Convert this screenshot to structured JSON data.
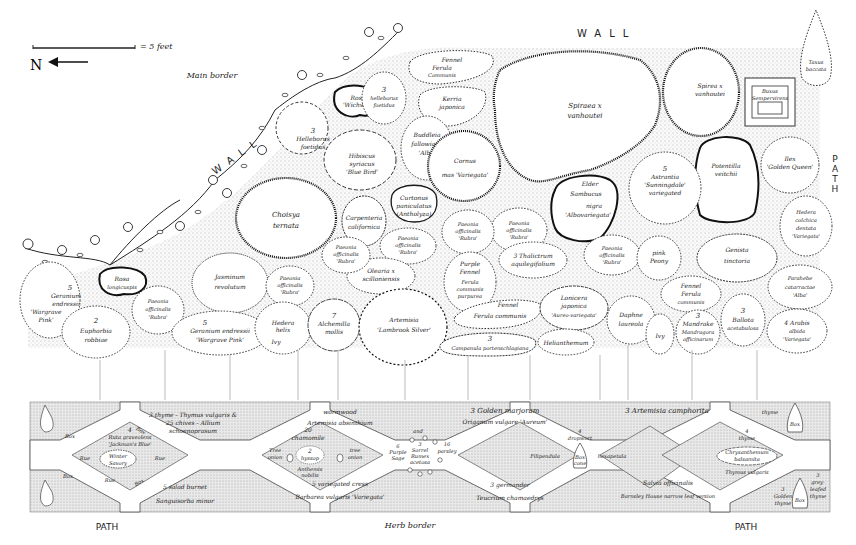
{
  "legend": {
    "scale_text": "= 5 feet",
    "north_label": "N"
  },
  "headings": {
    "wall_top": "WALL",
    "wall_diagonal": "WALL",
    "path_right": [
      "P",
      "A",
      "T",
      "H"
    ],
    "main_border": "Main border",
    "herb_border": "Herb border",
    "path_bottom_left": "PATH",
    "path_bottom_right": "PATH"
  },
  "main_border_plants": [
    {
      "id": "rosa-wichwar",
      "lines": [
        "Rosa",
        "'Wichwar'"
      ]
    },
    {
      "id": "helleborus-1",
      "lines": [
        "3",
        "helleborus",
        "foetidus"
      ]
    },
    {
      "id": "ferula-fennel",
      "lines": [
        "Fennel",
        "Ferula",
        "Communis"
      ]
    },
    {
      "id": "kerria",
      "lines": [
        "Kerria",
        "japonica"
      ]
    },
    {
      "id": "spiraea-large",
      "lines": [
        "Spiraea x",
        "vanhoutei"
      ]
    },
    {
      "id": "spiraea-small",
      "lines": [
        "Spirea x",
        "vanhoutei"
      ]
    },
    {
      "id": "buxus",
      "lines": [
        "Buxus",
        "Sempervirens"
      ]
    },
    {
      "id": "taxus",
      "lines": [
        "Taxus",
        "baccata"
      ]
    },
    {
      "id": "helleborus-2",
      "lines": [
        "3",
        "Helleborus",
        "foetidus"
      ]
    },
    {
      "id": "buddleia",
      "lines": [
        "Buddleia",
        "fallowiana",
        "'Alba'"
      ]
    },
    {
      "id": "hibiscus",
      "lines": [
        "Hibiscus",
        "syriacus",
        "'Blue Bird'"
      ]
    },
    {
      "id": "cornus",
      "lines": [
        "Cornus",
        "mas 'Variegata'"
      ]
    },
    {
      "id": "ilex",
      "lines": [
        "Ilex",
        "'Golden Queen'"
      ]
    },
    {
      "id": "potentilla",
      "lines": [
        "Potentilla",
        "veitchii"
      ]
    },
    {
      "id": "astrantia",
      "lines": [
        "5",
        "Astrantia",
        "'Sunningdale'",
        "variegated"
      ]
    },
    {
      "id": "sambucus",
      "lines": [
        "Elder",
        "Sambucus",
        "nigra",
        "'Albovariegata'"
      ]
    },
    {
      "id": "choisya",
      "lines": [
        "Choisya",
        "ternata"
      ]
    },
    {
      "id": "carpenteria",
      "lines": [
        "Carpenteria",
        "californica"
      ]
    },
    {
      "id": "curtonus",
      "lines": [
        "Curtonus",
        "paniculatus",
        "(Antholyza)"
      ]
    },
    {
      "id": "paeonia-a",
      "lines": [
        "Paeonia",
        "officinalis",
        "'Rubra'"
      ]
    },
    {
      "id": "paeonia-b",
      "lines": [
        "Paeonia",
        "officinalis",
        "'Rubra'"
      ]
    },
    {
      "id": "paeonia-c",
      "lines": [
        "Paeonia",
        "officinalis",
        "'Rubra'"
      ]
    },
    {
      "id": "hedera-colchica",
      "lines": [
        "Hedera",
        "colchica",
        "dentata",
        "'Variegata'"
      ]
    },
    {
      "id": "rosa-longicuspis",
      "lines": [
        "Rosa",
        "longicuspis"
      ]
    },
    {
      "id": "jasminum",
      "lines": [
        "Jasminum",
        "revolutum"
      ]
    },
    {
      "id": "paeonia-d",
      "lines": [
        "Paeonia",
        "officinalis",
        "'Rubra'"
      ]
    },
    {
      "id": "olearia",
      "lines": [
        "Olearia x",
        "scilloniensis"
      ]
    },
    {
      "id": "purple-fennel",
      "lines": [
        "Purple",
        "Fennel",
        "Ferula",
        "communis",
        "purpurea"
      ]
    },
    {
      "id": "thalictrum",
      "lines": [
        "3 Thalictrum",
        "aquilegifolium"
      ]
    },
    {
      "id": "paeonia-e",
      "lines": [
        "Paeonia",
        "officinalis",
        "'Rubra'"
      ]
    },
    {
      "id": "pink-peony",
      "lines": [
        "pink",
        "Peony"
      ]
    },
    {
      "id": "genista",
      "lines": [
        "Genista",
        "tinctoria"
      ]
    },
    {
      "id": "geranium-1",
      "lines": [
        "5",
        "Geranium",
        "endressii",
        "'Wargrave",
        "Pink'"
      ]
    },
    {
      "id": "paeonia-f",
      "lines": [
        "Paeonia",
        "officinalis",
        "'Rubra'"
      ]
    },
    {
      "id": "paeonia-g",
      "lines": [
        "Paeonia",
        "officinalis",
        "'Rubra'"
      ]
    },
    {
      "id": "parahebe",
      "lines": [
        "Parahebe",
        "catarractae",
        "'Alba'"
      ]
    },
    {
      "id": "euphorbia",
      "lines": [
        "2",
        "Euphorbia",
        "robbiae"
      ]
    },
    {
      "id": "geranium-2",
      "lines": [
        "5",
        "Geranium endressii",
        "'Wargrave Pink'"
      ]
    },
    {
      "id": "hedera-helix",
      "lines": [
        "Hedera",
        "helix",
        "Ivy"
      ]
    },
    {
      "id": "alchemilla",
      "lines": [
        "7",
        "Alchemilla",
        "mollis"
      ]
    },
    {
      "id": "artemisia-lambrook",
      "lines": [
        "Artemisia",
        "'Lambrook Silver'"
      ]
    },
    {
      "id": "fennel",
      "lines": [
        "Fennel",
        "Ferula communis"
      ]
    },
    {
      "id": "campanula",
      "lines": [
        "3",
        "Campanula portenschlagiana"
      ]
    },
    {
      "id": "lonicera",
      "lines": [
        "Lonicera",
        "japonica",
        "'Aureo-variegata'"
      ]
    },
    {
      "id": "helianthemum",
      "lines": [
        "Helianthemum"
      ]
    },
    {
      "id": "daphne",
      "lines": [
        "Daphne",
        "laureola"
      ]
    },
    {
      "id": "ivy-small",
      "lines": [
        "Ivy"
      ]
    },
    {
      "id": "fennel-2",
      "lines": [
        "Fennel",
        "Ferula",
        "communis"
      ]
    },
    {
      "id": "mandrake",
      "lines": [
        "3",
        "Mandrake",
        "Mandragora",
        "officinarum"
      ]
    },
    {
      "id": "ballota",
      "lines": [
        "3",
        "Ballota",
        "acetabulosa"
      ]
    },
    {
      "id": "arabis",
      "lines": [
        "4 Arabis",
        "albida",
        "'Variegata'"
      ]
    }
  ],
  "herb_border": {
    "top_labels": [
      {
        "id": "thyme-chives",
        "lines": [
          "3 thyme - Thymus vulgaris &",
          "25 chives - Allium",
          "schoenoprasum"
        ]
      },
      {
        "id": "wormwood",
        "lines": [
          "wormwood",
          "Artemisia absinthium"
        ]
      },
      {
        "id": "golden-marjoram",
        "lines": [
          "3 Golden marjoram",
          "Origanum vulgare 'Aureum'"
        ]
      },
      {
        "id": "artemisia-camphorata",
        "lines": [
          "3 Artemisia camphorita"
        ]
      },
      {
        "id": "thyme-top-right",
        "lines": [
          "thyme"
        ]
      }
    ],
    "bottom_labels": [
      {
        "id": "salad-burnet",
        "lines": [
          "5 salad burnet",
          "Sanguisorba minor"
        ]
      },
      {
        "id": "variegated-cress",
        "lines": [
          "5 variegated cress",
          "Barbarea vulgaris 'Variegata'"
        ]
      },
      {
        "id": "germander",
        "lines": [
          "3 germander",
          "Teucrium chamaedrys"
        ]
      },
      {
        "id": "salvia",
        "lines": [
          "Salvia officinalis",
          "Barnsley House narrow leaf version"
        ]
      },
      {
        "id": "golden-thyme",
        "lines": [
          "3",
          "Golden",
          "thyme"
        ]
      },
      {
        "id": "grey-leafed-thyme",
        "lines": [
          "3",
          "grey-",
          "leafed",
          "thyme"
        ]
      }
    ],
    "diamonds": [
      {
        "id": "ruta",
        "lines": [
          "4",
          "Ruta graveolens",
          "'Jackman's Blue'"
        ],
        "center": [
          "Winter",
          "Savory"
        ],
        "edge": [
          "Rue",
          "Rue",
          "Rue"
        ],
        "box": [
          "Box",
          "Box",
          "Box",
          "Box"
        ]
      },
      {
        "id": "chamomile",
        "lines": [
          "20",
          "chamomile"
        ],
        "center": [
          "2",
          "hyssop"
        ],
        "extra": [
          "Anthemis",
          "nobilis"
        ],
        "side_left": [
          "Tree",
          "onion"
        ],
        "side_right": [
          "tree",
          "onion"
        ]
      },
      {
        "id": "sage-sorrel",
        "lines": [
          "and"
        ],
        "left": [
          "6",
          "Purple",
          "Sage"
        ],
        "center": [
          "3",
          "Sorrel",
          "Rumex",
          "acetosa"
        ],
        "right": [
          "16",
          "parsley"
        ]
      },
      {
        "id": "filipendula",
        "lines": [
          "4",
          "dropwort"
        ],
        "left": [
          "Filipendula"
        ],
        "center": [
          "Box",
          "cone"
        ],
        "right": [
          "hexapetala"
        ]
      },
      {
        "id": "chrysanthemum",
        "lines": [
          "4",
          "thyme"
        ],
        "center": [
          "Chrysanthemum",
          "balsamita"
        ],
        "bottom": [
          "Thymus vulgaris"
        ]
      }
    ],
    "cones": [
      {
        "id": "box-top-right",
        "label": "Box"
      },
      {
        "id": "box-bottom-right",
        "label": "Box"
      }
    ]
  }
}
